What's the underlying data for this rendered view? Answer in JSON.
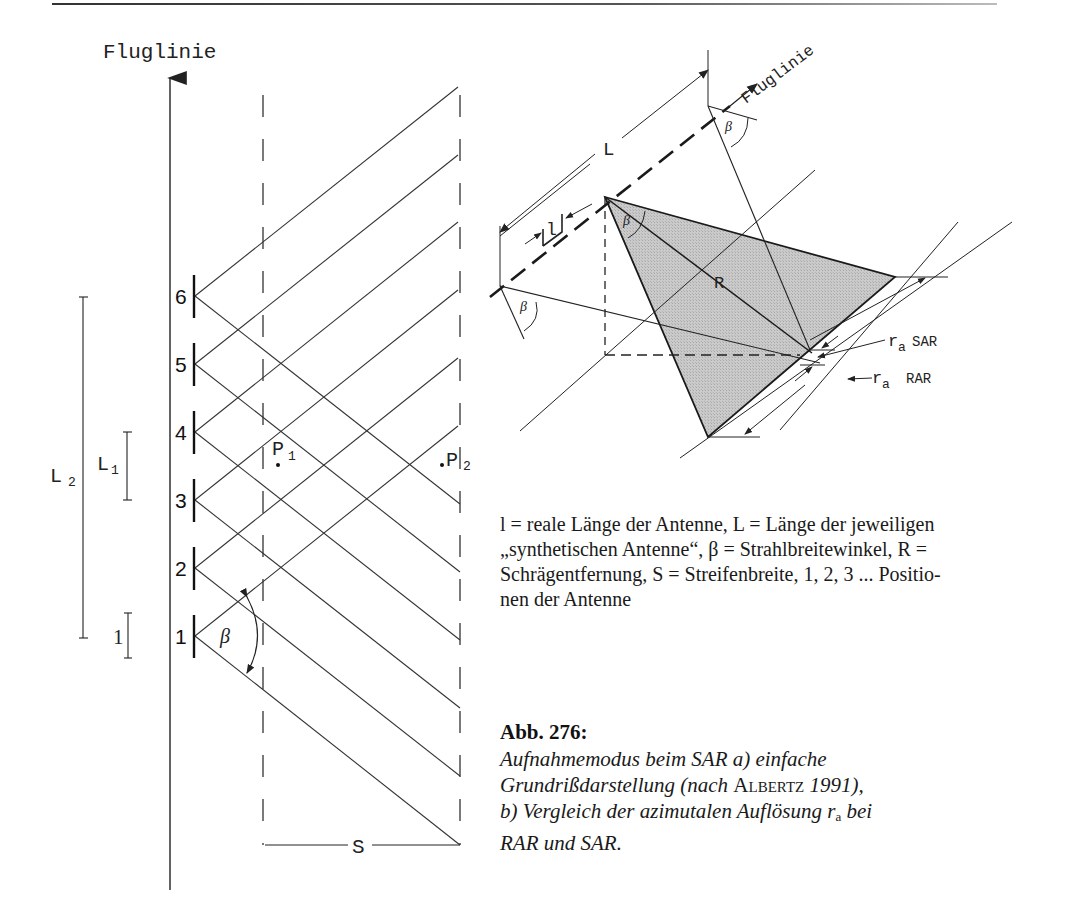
{
  "page": {
    "figure_number": "Abb. 276:",
    "caption_lines": [
      "Aufnahmemodus beim SAR a) einfache",
      "Grundrißdarstellung (nach ",
      "b) Vergleich der azimutalen Auflösung r",
      "RAR und SAR."
    ],
    "caption_author": "Albertz",
    "caption_year": " 1991),",
    "caption_sub_a": "a",
    "caption_after_sub": " bei",
    "legend_lines": [
      "l = reale Länge der Antenne, L = Länge der jeweiligen",
      "„synthetischen Antenne“, β = Strahlbreitewinkel, R =",
      "Schrägentfernung, S = Streifenbreite, 1, 2, 3 ... Positio-",
      "nen der Antenne"
    ]
  },
  "diagram_a": {
    "flight_line_label": "Fluglinie",
    "antenna_positions": [
      "6",
      "5",
      "4",
      "3",
      "2",
      "1"
    ],
    "scale_labels": {
      "L2": "L",
      "L2_sub": "2",
      "L1": "L",
      "L1_sub": "1",
      "l": "1"
    },
    "points": [
      {
        "label": "P",
        "sub": "1"
      },
      {
        "label": "P",
        "sub": "2"
      }
    ],
    "angle_label": "β",
    "swath_label": "S"
  },
  "diagram_b": {
    "flight_line_label": "Fluglinie",
    "synthetic_length_label": "L",
    "real_length_label": "l",
    "range_label": "R",
    "angle_label": "β",
    "resolution_sar": {
      "symbol": "r",
      "sub": "a",
      "system": "SAR"
    },
    "resolution_rar": {
      "symbol": "r",
      "sub": "a",
      "system": "RAR"
    },
    "colors": {
      "footprint_fill": "#c4c4c4",
      "line": "#222222"
    }
  }
}
